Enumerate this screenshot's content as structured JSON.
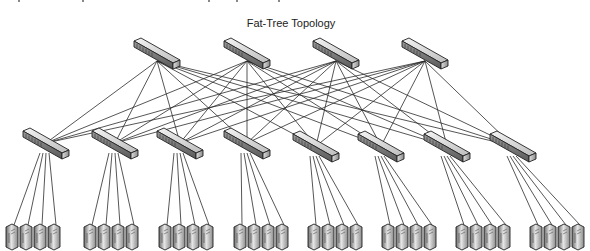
{
  "diagram": {
    "title": "Fat-Tree Topology",
    "type": "network-topology",
    "colors": {
      "background": "#ffffff",
      "link": "#2b2b2b",
      "device_dark": "#555555",
      "device_light": "#e8e8e8",
      "title": "#222222"
    },
    "layers": [
      {
        "name": "core",
        "count": 4,
        "nodes": [
          {
            "id": "core-1",
            "kind": "switch",
            "x": 157,
            "y": 57
          },
          {
            "id": "core-2",
            "kind": "switch",
            "x": 247,
            "y": 57
          },
          {
            "id": "core-3",
            "kind": "switch",
            "x": 336,
            "y": 57
          },
          {
            "id": "core-4",
            "kind": "switch",
            "x": 425,
            "y": 57
          }
        ]
      },
      {
        "name": "aggregation",
        "count": 8,
        "nodes": [
          {
            "id": "agg-1",
            "kind": "switch",
            "x": 46,
            "y": 147
          },
          {
            "id": "agg-2",
            "kind": "switch",
            "x": 115,
            "y": 147
          },
          {
            "id": "agg-3",
            "kind": "switch",
            "x": 180,
            "y": 147
          },
          {
            "id": "agg-4",
            "kind": "switch",
            "x": 247,
            "y": 147
          },
          {
            "id": "agg-5",
            "kind": "switch",
            "x": 316,
            "y": 150
          },
          {
            "id": "agg-6",
            "kind": "switch",
            "x": 381,
            "y": 150
          },
          {
            "id": "agg-7",
            "kind": "switch",
            "x": 447,
            "y": 150
          },
          {
            "id": "agg-8",
            "kind": "switch",
            "x": 513,
            "y": 150
          }
        ]
      },
      {
        "name": "servers",
        "count": 32,
        "groups": [
          {
            "agg": "agg-1",
            "x": [
              12,
              26,
              40,
              54
            ]
          },
          {
            "agg": "agg-2",
            "x": [
              90,
              104,
              118,
              132
            ]
          },
          {
            "agg": "agg-3",
            "x": [
              165,
              179,
              193,
              207
            ]
          },
          {
            "agg": "agg-4",
            "x": [
              240,
              254,
              268,
              282
            ]
          },
          {
            "agg": "agg-5",
            "x": [
              314,
              328,
              342,
              356
            ]
          },
          {
            "agg": "agg-6",
            "x": [
              388,
              402,
              416,
              430
            ]
          },
          {
            "agg": "agg-7",
            "x": [
              462,
              476,
              490,
              504
            ]
          },
          {
            "agg": "agg-8",
            "x": [
              536,
              550,
              564,
              578
            ]
          }
        ],
        "y": 237
      }
    ],
    "links": {
      "core_to_aggregation": "full-mesh (each of 4 core switches connects to all 8 aggregation switches)",
      "aggregation_to_server": "each aggregation switch connects to its 4 servers"
    }
  }
}
